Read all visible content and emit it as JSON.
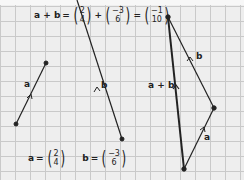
{
  "equation_sum": {
    "lhs": "a + b",
    "eq": "=",
    "plus": "+",
    "a_vec": [
      "2",
      "4"
    ],
    "b_vec": [
      "−3",
      "6"
    ],
    "result": [
      "−1",
      "10"
    ]
  },
  "definitions": {
    "a_label": "a",
    "a_eq": "=",
    "a_vec": [
      "2",
      "4"
    ],
    "b_label": "b",
    "b_eq": "=",
    "b_vec": [
      "−3",
      "6"
    ]
  },
  "vector_labels": {
    "a_left": "a",
    "b_middle": "b",
    "b_triangle": "b",
    "a_triangle": "a",
    "sum_triangle": "a + b"
  },
  "colors": {
    "grid": "#c9c9c9",
    "background": "#eeeeee",
    "line": "#222222"
  }
}
